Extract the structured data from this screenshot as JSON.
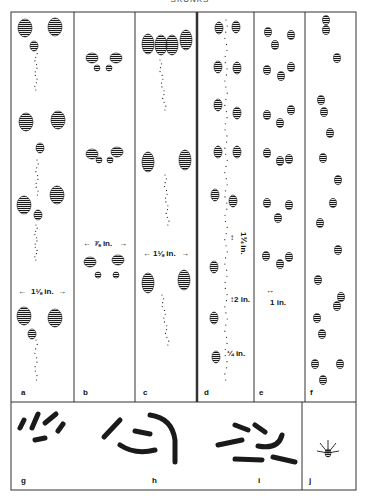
{
  "header": {
    "text": "SKUNKS"
  },
  "panels": [
    {
      "id": "a",
      "label": "a",
      "measurement": "1⅛ in.",
      "content": "track-pattern"
    },
    {
      "id": "b",
      "label": "b",
      "measurement": "⅞ in.",
      "content": "track-pattern"
    },
    {
      "id": "c",
      "label": "c",
      "measurement": "1⅛ in.",
      "content": "track-pattern"
    },
    {
      "id": "d",
      "label": "d",
      "measurements": [
        "1¾ in.",
        "2 in.",
        "¼ in."
      ],
      "content": "track-pattern-with-tail-drag"
    },
    {
      "id": "e",
      "label": "e",
      "measurement": "1 in.",
      "content": "track-pattern"
    },
    {
      "id": "f",
      "label": "f",
      "content": "track-pattern"
    },
    {
      "id": "g",
      "label": "g",
      "content": "scat"
    },
    {
      "id": "h",
      "label": "h",
      "content": "scat"
    },
    {
      "id": "i",
      "label": "i",
      "content": "scat"
    },
    {
      "id": "j",
      "label": "j",
      "content": "single-footprint"
    }
  ],
  "colors": {
    "ink": "#1a1a1a",
    "paper": "#ffffff",
    "border": "#333333"
  }
}
